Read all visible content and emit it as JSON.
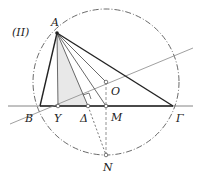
{
  "figure_label": "(II)",
  "points": {
    "A": {
      "label": "A",
      "x": 57,
      "y": 33
    },
    "B": {
      "label": "B",
      "x": 40,
      "y": 106
    },
    "Gamma": {
      "label": "Γ",
      "x": 173,
      "y": 106
    },
    "Y": {
      "label": "Y",
      "x": 58,
      "y": 106
    },
    "Delta": {
      "label": "Δ",
      "x": 88,
      "y": 106
    },
    "M": {
      "label": "M",
      "x": 106,
      "y": 106
    },
    "O": {
      "label": "O",
      "x": 106,
      "y": 82
    },
    "N": {
      "label": "N",
      "x": 106,
      "y": 155
    }
  },
  "circle": {
    "cx": 106,
    "cy": 82,
    "r": 73,
    "style": "dashed"
  },
  "colors": {
    "dark": "#222222",
    "gray": "#888888",
    "fill": "#e6e6e6"
  }
}
